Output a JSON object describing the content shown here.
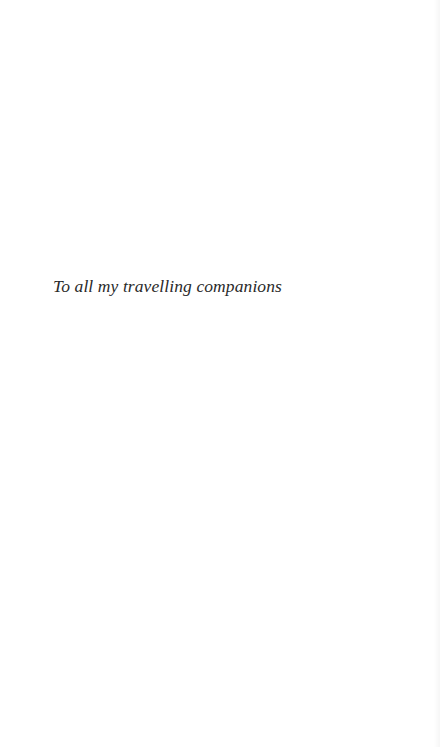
{
  "page": {
    "type": "dedication",
    "text": "To all my travelling companions"
  },
  "colors": {
    "background": "#ffffff",
    "text": "#2a2a2a"
  }
}
